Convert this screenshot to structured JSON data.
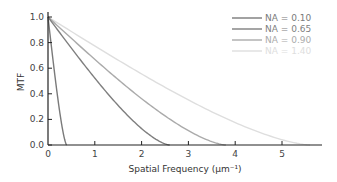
{
  "chart_data": {
    "type": "line",
    "title": "",
    "xlabel": "Spatial Frequency (μm⁻¹)",
    "ylabel": "MTF",
    "xlim": [
      0,
      5.8
    ],
    "ylim": [
      0,
      1.0
    ],
    "x_ticks": [
      "0",
      "1",
      "2",
      "3",
      "4",
      "5"
    ],
    "y_ticks": [
      "0.0",
      "0.2",
      "0.4",
      "0.6",
      "0.8",
      "1.0"
    ],
    "grid": false,
    "legend_position": "upper right",
    "series": [
      {
        "name": "NA = 0.10",
        "cutoff": 0.4,
        "color": "#7a7a7a"
      },
      {
        "name": "NA = 0.65",
        "cutoff": 2.6,
        "color": "#7f7f7f"
      },
      {
        "name": "NA = 0.90",
        "cutoff": 3.8,
        "color": "#ababab"
      },
      {
        "name": "NA = 1.40",
        "cutoff": 5.6,
        "color": "#dedede"
      }
    ],
    "sample_points": {
      "NA = 0.10": {
        "x": [
          0,
          0.1,
          0.2,
          0.3,
          0.4
        ],
        "y": [
          1.0,
          0.69,
          0.39,
          0.14,
          0.0
        ]
      },
      "NA = 0.65": {
        "x": [
          0,
          0.5,
          1.0,
          1.5,
          2.0,
          2.6
        ],
        "y": [
          1.0,
          0.76,
          0.53,
          0.32,
          0.14,
          0.0
        ]
      },
      "NA = 0.90": {
        "x": [
          0,
          1.0,
          2.0,
          3.0,
          3.8
        ],
        "y": [
          1.0,
          0.67,
          0.37,
          0.12,
          0.0
        ]
      },
      "NA = 1.40": {
        "x": [
          0,
          1.0,
          2.0,
          3.0,
          4.0,
          5.0,
          5.6
        ],
        "y": [
          1.0,
          0.77,
          0.56,
          0.36,
          0.19,
          0.05,
          0.0
        ]
      }
    }
  }
}
